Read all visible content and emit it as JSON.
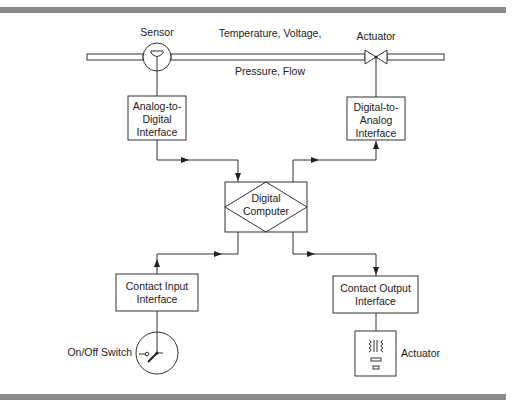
{
  "diagram": {
    "type": "process-control-block-diagram",
    "process_line": {
      "label_top": "Temperature, Voltage,",
      "label_bottom": "Pressure, Flow"
    },
    "sensor": {
      "label": "Sensor",
      "icon": "sensor-icon"
    },
    "valve_actuator": {
      "label": "Actuator",
      "icon": "valve-icon"
    },
    "adc": {
      "lines": [
        "Analog-to-",
        "Digital",
        "Interface"
      ]
    },
    "dac": {
      "lines": [
        "Digital-to-",
        "Analog",
        "Interface"
      ]
    },
    "computer": {
      "lines": [
        "Digital",
        "Computer"
      ]
    },
    "contact_input": {
      "lines": [
        "Contact Input",
        "Interface"
      ]
    },
    "contact_output": {
      "lines": [
        "Contact Output",
        "Interface"
      ]
    },
    "switch": {
      "label": "On/Off Switch",
      "icon": "switch-icon"
    },
    "output_actuator": {
      "label": "Actuator",
      "icon": "relay-actuator-icon"
    },
    "connections": [
      {
        "from": "sensor",
        "to": "adc"
      },
      {
        "from": "adc",
        "to": "computer",
        "arrow": true
      },
      {
        "from": "computer",
        "to": "dac",
        "arrow": true
      },
      {
        "from": "dac",
        "to": "valve_actuator",
        "arrow": true
      },
      {
        "from": "switch",
        "to": "contact_input"
      },
      {
        "from": "contact_input",
        "to": "computer",
        "arrow": true
      },
      {
        "from": "computer",
        "to": "contact_output",
        "arrow": true
      },
      {
        "from": "contact_output",
        "to": "output_actuator"
      }
    ],
    "colors": {
      "line": "#333333",
      "bar": "#8a8a8a",
      "background": "#ffffff"
    }
  }
}
